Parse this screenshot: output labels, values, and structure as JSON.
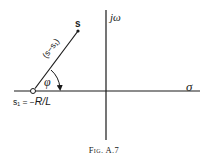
{
  "figure": {
    "caption": "Fig. A.7",
    "labels": {
      "point_s": "s",
      "imag_axis": "jω",
      "real_axis": "σ",
      "angle": "φ",
      "vector": "(s−s₁)",
      "pole_prefix": "s₁ = −",
      "pole_value": "R/L"
    },
    "geometry": {
      "real_axis": {
        "x1": 14,
        "y1": 91,
        "x2": 200,
        "y2": 91
      },
      "imag_axis": {
        "x1": 106,
        "y1": 10,
        "x2": 106,
        "y2": 140
      },
      "pole_s1": {
        "cx": 33,
        "cy": 91,
        "r": 2.5
      },
      "point_s": {
        "cx": 78,
        "cy": 31,
        "r": 1.6
      }
    },
    "colors": {
      "ink": "#1a1a1a",
      "background": "#ffffff"
    }
  }
}
